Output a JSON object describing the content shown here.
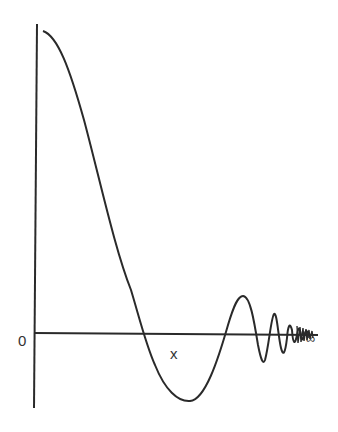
{
  "figure": {
    "origin_label": "0",
    "x_label": "x",
    "infinity_label": "∞"
  },
  "colors": {
    "line": "#2a2a2a",
    "background": "#ffffff"
  }
}
